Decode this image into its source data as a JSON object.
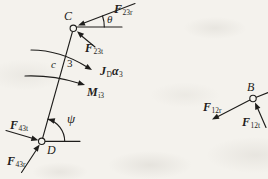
{
  "colors": {
    "paper": "#f4f2ed",
    "ink": "#1e1d1b"
  },
  "left_diagram": {
    "joint_c": "C",
    "joint_d": "D",
    "link_number": "3",
    "curvature_label": "c",
    "angle_theta": "θ",
    "angle_psi": "ψ",
    "force_f23r": {
      "symbol": "F",
      "sub": "23r"
    },
    "force_f23t": {
      "symbol": "F",
      "sub": "23t"
    },
    "force_f43t": {
      "symbol": "F",
      "sub": "43t"
    },
    "force_f43r": {
      "symbol": "F",
      "sub": "43r"
    },
    "inertia_torque": {
      "symbol": "J",
      "sub": "D",
      "symbol2": "α",
      "sub2": "3"
    },
    "inertia_moment": {
      "symbol": "M",
      "sub": "i3"
    }
  },
  "right_diagram": {
    "joint_b": "B",
    "force_f12r": {
      "symbol": "F",
      "sub": "12r"
    },
    "force_f12t": {
      "symbol": "F",
      "sub": "12t"
    }
  }
}
